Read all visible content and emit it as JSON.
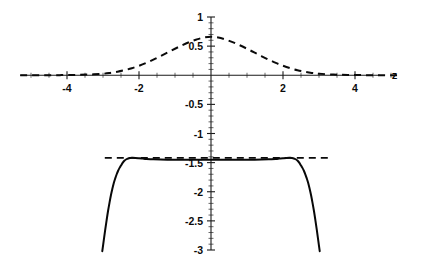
{
  "chart_data": {
    "type": "line",
    "title": "",
    "xlabel": "z",
    "ylabel": "",
    "xlim": [
      -5.3,
      5.3
    ],
    "ylim": [
      -3.0,
      1.0
    ],
    "grid": false,
    "legend": null,
    "axis_style": "centered-cross",
    "x_ticks": [
      -4,
      -2,
      2,
      4
    ],
    "x_tick_labels": [
      "-4",
      "-2",
      "2",
      "4"
    ],
    "y_ticks": [
      1,
      0.5,
      -0.5,
      -1,
      -1.5,
      -2,
      -2.5,
      -3
    ],
    "y_tick_labels": [
      "1",
      "0.5",
      "-0.5",
      "-1",
      "-1.5",
      "-2",
      "-2.5",
      "-3"
    ],
    "x_minor_step": 0.5,
    "y_minor_step": 0.1,
    "series": [
      {
        "name": "gaussian-density",
        "style": "dashed",
        "comment": "Bell curve peaking near 0.8 at z = 0",
        "x": [
          -5.3,
          -5.0,
          -4.6,
          -4.2,
          -3.8,
          -3.4,
          -3.0,
          -2.8,
          -2.6,
          -2.4,
          -2.2,
          -2.0,
          -1.8,
          -1.6,
          -1.4,
          -1.2,
          -1.0,
          -0.8,
          -0.6,
          -0.4,
          -0.2,
          0.0,
          0.2,
          0.4,
          0.6,
          0.8,
          1.0,
          1.2,
          1.4,
          1.6,
          1.8,
          2.0,
          2.2,
          2.4,
          2.6,
          2.8,
          3.0,
          3.4,
          3.8,
          4.2,
          4.6,
          5.0,
          5.3
        ],
        "y": [
          0.0,
          0.0,
          0.001,
          0.002,
          0.005,
          0.012,
          0.026,
          0.04,
          0.06,
          0.087,
          0.121,
          0.163,
          0.212,
          0.268,
          0.329,
          0.392,
          0.455,
          0.515,
          0.569,
          0.614,
          0.648,
          0.66,
          0.648,
          0.614,
          0.569,
          0.515,
          0.455,
          0.392,
          0.329,
          0.268,
          0.212,
          0.163,
          0.121,
          0.087,
          0.06,
          0.04,
          0.026,
          0.012,
          0.005,
          0.002,
          0.001,
          0.0,
          0.0
        ]
      },
      {
        "name": "log-density-curve",
        "style": "solid",
        "comment": "Flat plateau near -1.42 with small bumps near z = -2.3 and z = 2.3, falling steeply past |z| = 2.8",
        "x": [
          -3.02,
          -2.98,
          -2.94,
          -2.9,
          -2.86,
          -2.82,
          -2.78,
          -2.74,
          -2.7,
          -2.66,
          -2.62,
          -2.58,
          -2.54,
          -2.5,
          -2.45,
          -2.4,
          -2.35,
          -2.3,
          -2.25,
          -2.2,
          -2.1,
          -2.0,
          -1.9,
          -1.8,
          -1.6,
          -1.4,
          -1.2,
          -1.0,
          -0.8,
          -0.6,
          -0.4,
          -0.2,
          0.0,
          0.2,
          0.4,
          0.6,
          0.8,
          1.0,
          1.2,
          1.4,
          1.6,
          1.8,
          1.9,
          2.0,
          2.1,
          2.2,
          2.25,
          2.3,
          2.35,
          2.4,
          2.45,
          2.5,
          2.54,
          2.58,
          2.62,
          2.66,
          2.7,
          2.74,
          2.78,
          2.82,
          2.86,
          2.9,
          2.94,
          2.98,
          3.02
        ],
        "y": [
          -3.02,
          -2.84,
          -2.66,
          -2.49,
          -2.33,
          -2.19,
          -2.06,
          -1.95,
          -1.85,
          -1.77,
          -1.7,
          -1.64,
          -1.59,
          -1.55,
          -1.5,
          -1.465,
          -1.442,
          -1.428,
          -1.421,
          -1.418,
          -1.419,
          -1.424,
          -1.43,
          -1.436,
          -1.444,
          -1.448,
          -1.45,
          -1.451,
          -1.452,
          -1.452,
          -1.452,
          -1.452,
          -1.452,
          -1.452,
          -1.452,
          -1.452,
          -1.452,
          -1.451,
          -1.45,
          -1.448,
          -1.444,
          -1.436,
          -1.43,
          -1.424,
          -1.419,
          -1.418,
          -1.421,
          -1.428,
          -1.442,
          -1.465,
          -1.5,
          -1.55,
          -1.59,
          -1.64,
          -1.7,
          -1.77,
          -1.85,
          -1.95,
          -2.06,
          -2.19,
          -2.33,
          -2.49,
          -2.66,
          -2.84,
          -3.02
        ]
      }
    ],
    "asymptote": {
      "name": "horizontal-asymptote",
      "style": "dashed",
      "y": -1.42,
      "x_start": -2.95,
      "x_end": 3.35
    },
    "colors": {
      "curve": "#080808",
      "axis": "#1a1a1a",
      "background": "#ffffff",
      "text": "#0b0b0b"
    }
  }
}
